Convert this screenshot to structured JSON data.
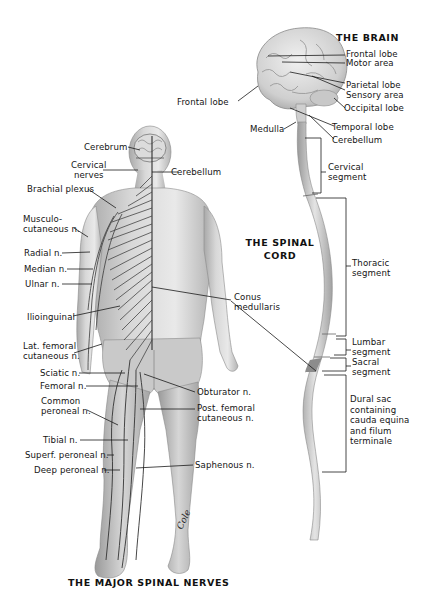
{
  "figure": {
    "titles": {
      "brain": "THE BRAIN",
      "spinal_cord_line1": "THE SPINAL",
      "spinal_cord_line2": "CORD",
      "spinal_nerves": "THE MAJOR SPINAL NERVES"
    },
    "signature": "Cole",
    "brain_labels": {
      "frontal_lobe": "Frontal lobe",
      "motor_area": "Motor area",
      "parietal_lobe": "Parietal lobe",
      "sensory_area": "Sensory area",
      "occipital_lobe": "Occipital lobe",
      "frontal_lobe_left": "Frontal lobe",
      "temporal_lobe": "Temporal lobe",
      "medulla": "Medulla",
      "cerebellum": "Cerebellum"
    },
    "cord_labels": {
      "cervical_1": "Cervical",
      "cervical_2": "segment",
      "thoracic_1": "Thoracic",
      "thoracic_2": "segment",
      "lumbar_1": "Lumbar",
      "lumbar_2": "segment",
      "sacral_1": "Sacral",
      "sacral_2": "segment",
      "dural_1": "Dural sac",
      "dural_2": "containing",
      "dural_3": "cauda equina",
      "dural_4": "and filum",
      "dural_5": "terminale",
      "conus_1": "Conus",
      "conus_2": "medullaris"
    },
    "body_labels": {
      "cerebrum": "Cerebrum",
      "cerebellum": "Cerebellum",
      "cervical_1": "Cervical",
      "cervical_2": "nerves",
      "brachial_plexus": "Brachial plexus",
      "musculo_1": "Musculo-",
      "musculo_2": "cutaneous n.",
      "radial": "Radial n.",
      "median": "Median n.",
      "ulnar": "Ulnar n.",
      "ilioinguinal": "Ilioinguinal",
      "lat_femoral_1": "Lat. femoral",
      "lat_femoral_2": "cutaneous n.",
      "sciatic": "Sciatic n.",
      "femoral": "Femoral n.",
      "common_peroneal_1": "Common",
      "common_peroneal_2": "peroneal n.",
      "tibial": "Tibial n.",
      "superf_peroneal": "Superf. peroneal n.",
      "deep_peroneal": "Deep peroneal n.",
      "obturator": "Obturator n.",
      "post_femoral_1": "Post. femoral",
      "post_femoral_2": "cutaneous n.",
      "saphenous": "Saphenous n."
    },
    "colors": {
      "skin_light": "#e6e6e6",
      "skin_mid": "#c4c4c4",
      "skin_dark": "#8d8d8d",
      "nerve": "#3a3a3a",
      "leader": "#1a1a1a"
    }
  }
}
